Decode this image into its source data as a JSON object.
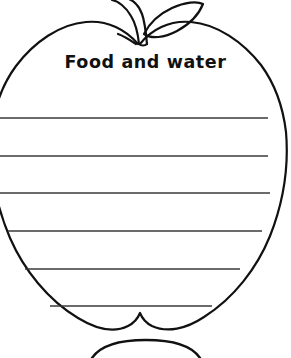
{
  "page": {
    "kind": "printable-worksheet",
    "title": "Food and water",
    "background_color": "#ffffff",
    "ink_color": "#111111",
    "width": 291,
    "height": 358
  },
  "shape": {
    "name": "apple-outline",
    "stroke_color": "#111111",
    "stroke_width": 2.2,
    "fill": "none",
    "parts": [
      {
        "name": "apple-body",
        "label": "apple body outline"
      },
      {
        "name": "apple-stem",
        "label": "apple stem"
      },
      {
        "name": "apple-leaf",
        "label": "apple leaf"
      },
      {
        "name": "apple-bottom-notch",
        "label": "bottom dimple"
      }
    ]
  },
  "writing_lines": {
    "count": 6,
    "stroke_color": "#3a3a3a",
    "stroke_width": 1.6,
    "items": [
      {
        "index": 1,
        "y": 118,
        "x1": 0,
        "x2": 268
      },
      {
        "index": 2,
        "y": 156,
        "x1": 0,
        "x2": 268
      },
      {
        "index": 3,
        "y": 193,
        "x1": 0,
        "x2": 270
      },
      {
        "index": 4,
        "y": 231,
        "x1": 8,
        "x2": 262
      },
      {
        "index": 5,
        "y": 269,
        "x1": 25,
        "x2": 240
      },
      {
        "index": 6,
        "y": 306,
        "x1": 50,
        "x2": 212
      }
    ]
  },
  "bottom_partial": {
    "name": "next-shape-top-edge",
    "label": "top edge of next apple template, clipped by page bottom"
  }
}
